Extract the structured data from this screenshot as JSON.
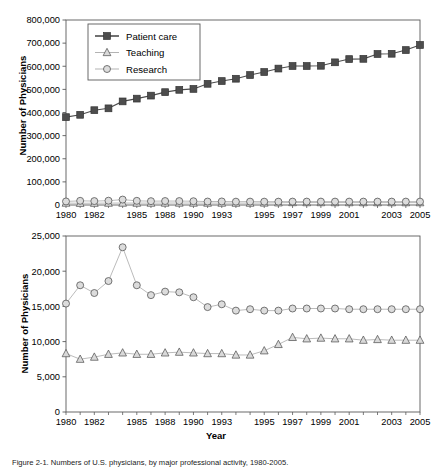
{
  "figure": {
    "caption": "Figure 2-1.  Numbers of U.S. physicians, by major professional activity, 1980-2005.",
    "xlabel": "Year",
    "ylabel": "Number of Physicians"
  },
  "chart_data": [
    {
      "type": "line",
      "panel": "top",
      "title": "",
      "xlabel": "Year",
      "ylabel": "Number of Physicians",
      "xlim": [
        1980,
        2005
      ],
      "ylim": [
        0,
        800000
      ],
      "ytick_labels": [
        "0",
        "100,000",
        "200,000",
        "300,000",
        "400,000",
        "500,000",
        "600,000",
        "700,000",
        "800,000"
      ],
      "ytick_values": [
        0,
        100000,
        200000,
        300000,
        400000,
        500000,
        600000,
        700000,
        800000
      ],
      "xtick_labels": [
        "1980",
        "1982",
        "1985",
        "1988",
        "1990",
        "1993",
        "1995",
        "1997",
        "1999",
        "2001",
        "2003",
        "2005"
      ],
      "grid": false,
      "legend_position": "upper-left",
      "x": [
        1980,
        1981,
        1982,
        1983,
        1984,
        1985,
        1986,
        1987,
        1988,
        1989,
        1990,
        1991,
        1992,
        1993,
        1994,
        1995,
        1996,
        1997,
        1998,
        1999,
        2000,
        2001,
        2002,
        2003,
        2004,
        2005
      ],
      "series": [
        {
          "name": "Patient care",
          "marker": "square-filled",
          "color": "#4d4d4d",
          "values": [
            380000,
            390000,
            410000,
            418000,
            448000,
            460000,
            473000,
            488000,
            498000,
            502000,
            524000,
            536000,
            546000,
            562000,
            575000,
            590000,
            601000,
            601000,
            602000,
            617000,
            631000,
            632000,
            653000,
            654000,
            670000,
            692000
          ]
        },
        {
          "name": "Teaching",
          "marker": "triangle-open",
          "color": "#b3b3b3",
          "values": [
            8300,
            7500,
            7800,
            8200,
            8400,
            8200,
            8200,
            8400,
            8500,
            8400,
            8300,
            8300,
            8100,
            8100,
            8700,
            9600,
            10600,
            10400,
            10500,
            10400,
            10400,
            10200,
            10300,
            10200,
            10200,
            10200
          ]
        },
        {
          "name": "Research",
          "marker": "circle-open",
          "color": "#b3b3b3",
          "values": [
            15400,
            18000,
            16900,
            18600,
            23400,
            18000,
            16600,
            17100,
            17000,
            16300,
            14900,
            15300,
            14400,
            14600,
            14400,
            14400,
            14700,
            14700,
            14700,
            14700,
            14600,
            14600,
            14600,
            14600,
            14600,
            14600
          ]
        }
      ]
    },
    {
      "type": "line",
      "panel": "bottom",
      "title": "",
      "xlabel": "Year",
      "ylabel": "Number of Physicians",
      "xlim": [
        1980,
        2005
      ],
      "ylim": [
        0,
        25000
      ],
      "ytick_labels": [
        "0",
        "5,000",
        "10,000",
        "15,000",
        "20,000",
        "25,000"
      ],
      "ytick_values": [
        0,
        5000,
        10000,
        15000,
        20000,
        25000
      ],
      "xtick_labels": [
        "1980",
        "1982",
        "1985",
        "1988",
        "1990",
        "1993",
        "1995",
        "1997",
        "1999",
        "2001",
        "2003",
        "2005"
      ],
      "grid": false,
      "legend_position": "none",
      "x": [
        1980,
        1981,
        1982,
        1983,
        1984,
        1985,
        1986,
        1987,
        1988,
        1989,
        1990,
        1991,
        1992,
        1993,
        1994,
        1995,
        1996,
        1997,
        1998,
        1999,
        2000,
        2001,
        2002,
        2003,
        2004,
        2005
      ],
      "series": [
        {
          "name": "Research",
          "marker": "circle-open",
          "color": "#b3b3b3",
          "values": [
            15400,
            18000,
            16900,
            18600,
            23400,
            18000,
            16600,
            17100,
            17000,
            16300,
            14900,
            15300,
            14400,
            14600,
            14400,
            14400,
            14700,
            14700,
            14700,
            14700,
            14600,
            14600,
            14600,
            14600,
            14600,
            14600
          ]
        },
        {
          "name": "Teaching",
          "marker": "triangle-open",
          "color": "#b3b3b3",
          "values": [
            8300,
            7500,
            7800,
            8200,
            8400,
            8200,
            8200,
            8400,
            8500,
            8400,
            8300,
            8300,
            8100,
            8100,
            8700,
            9600,
            10600,
            10400,
            10500,
            10400,
            10400,
            10200,
            10300,
            10200,
            10200,
            10200
          ]
        }
      ]
    }
  ],
  "legend": {
    "items": [
      {
        "label": "Patient care",
        "marker": "square-filled",
        "color": "#4d4d4d"
      },
      {
        "label": "Teaching",
        "marker": "triangle-open",
        "color": "#b3b3b3"
      },
      {
        "label": "Research",
        "marker": "circle-open",
        "color": "#b3b3b3"
      }
    ]
  }
}
